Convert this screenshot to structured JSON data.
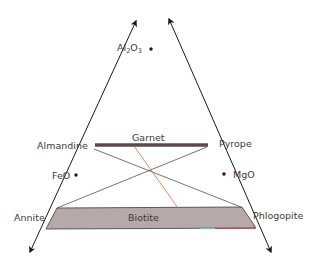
{
  "diagram": {
    "type": "ternary-composition-diagram",
    "apex": {
      "label_main": "Al",
      "label_sub1": "2",
      "label_mid": "O",
      "label_sub2": "3"
    },
    "vertices_labels": {
      "feo": "FeO",
      "mgo": "MgO"
    },
    "minerals": {
      "almandine": "Almandine",
      "pyrope": "Pyrope",
      "garnet": "Garnet",
      "annite": "Annite",
      "phlogopite": "Phlogopite",
      "biotite": "Biotite"
    },
    "colors": {
      "axis": "#1a1a1a",
      "garnet_bar": "#5a4a4e",
      "biotite_fill": "#b8a9a9",
      "tie_line": "#3a3a3a",
      "highlight_line": "#e06a3a",
      "label_text": "#3b3b3b"
    }
  }
}
